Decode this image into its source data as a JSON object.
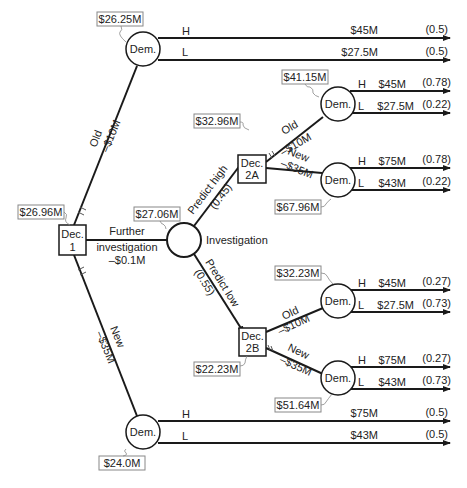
{
  "diagram": {
    "type": "decision-tree",
    "decision_nodes": [
      {
        "id": "dec1",
        "label_line1": "Dec.",
        "label_line2": "1",
        "value": "$26.96M"
      },
      {
        "id": "dec2a",
        "label_line1": "Dec.",
        "label_line2": "2A",
        "value": "$32.96M"
      },
      {
        "id": "dec2b",
        "label_line1": "Dec.",
        "label_line2": "2B",
        "value": "$22.23M"
      }
    ],
    "chance_nodes": [
      {
        "id": "dem_old",
        "label": "Dem.",
        "value": "$26.25M"
      },
      {
        "id": "investigation",
        "label": "Investigation",
        "value": "$27.06M"
      },
      {
        "id": "dem_new",
        "label": "Dem.",
        "value": "$24.0M"
      },
      {
        "id": "dem_2a_old",
        "label": "Dem.",
        "value": "$41.15M"
      },
      {
        "id": "dem_2a_new",
        "label": "Dem.",
        "value": "$67.96M"
      },
      {
        "id": "dem_2b_old",
        "label": "Dem.",
        "value": "$32.23M"
      },
      {
        "id": "dem_2b_new",
        "label": "Dem.",
        "value": "$51.64M"
      }
    ],
    "branches": {
      "old": {
        "name": "Old",
        "cost": "–$10M"
      },
      "new": {
        "name": "New",
        "cost": "–$35M"
      },
      "further": {
        "line1": "Further",
        "line2": "investigation",
        "line3": "–$0.1M"
      },
      "predict_high": {
        "name": "Predict high",
        "prob": "(0.45)"
      },
      "predict_low": {
        "name": "Predict low",
        "prob": "(0.55)"
      },
      "a_old": {
        "name": "Old",
        "cost": "–$10M"
      },
      "a_new": {
        "name": "New",
        "cost": "–$35M"
      },
      "b_old": {
        "name": "Old",
        "cost": "–$10M"
      },
      "b_new": {
        "name": "New",
        "cost": "–$35M"
      }
    },
    "outcomes": {
      "dem_old": [
        {
          "state": "H",
          "payoff": "$45M",
          "prob": "(0.5)"
        },
        {
          "state": "L",
          "payoff": "$27.5M",
          "prob": "(0.5)"
        }
      ],
      "dem_2a_old": [
        {
          "state": "H",
          "payoff": "$45M",
          "prob": "(0.78)"
        },
        {
          "state": "L",
          "payoff": "$27.5M",
          "prob": "(0.22)"
        }
      ],
      "dem_2a_new": [
        {
          "state": "H",
          "payoff": "$75M",
          "prob": "(0.78)"
        },
        {
          "state": "L",
          "payoff": "$43M",
          "prob": "(0.22)"
        }
      ],
      "dem_2b_old": [
        {
          "state": "H",
          "payoff": "$45M",
          "prob": "(0.27)"
        },
        {
          "state": "L",
          "payoff": "$27.5M",
          "prob": "(0.73)"
        }
      ],
      "dem_2b_new": [
        {
          "state": "H",
          "payoff": "$75M",
          "prob": "(0.27)"
        },
        {
          "state": "L",
          "payoff": "$43M",
          "prob": "(0.73)"
        }
      ],
      "dem_new": [
        {
          "state": "H",
          "payoff": "$75M",
          "prob": "(0.5)"
        },
        {
          "state": "L",
          "payoff": "$43M",
          "prob": "(0.5)"
        }
      ]
    }
  }
}
